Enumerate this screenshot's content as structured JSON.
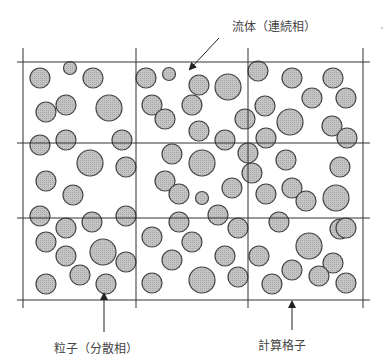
{
  "labels": {
    "fluid": "流体（連続相）",
    "particle": "粒子（分散相）",
    "grid": "計算格子"
  },
  "grid": {
    "x_lines": [
      23,
      136,
      248,
      363
    ],
    "y_lines": [
      62,
      143,
      218,
      300
    ],
    "extent": {
      "x_min": 17,
      "x_max": 370,
      "y_min": 48,
      "y_max": 308
    }
  },
  "colors": {
    "particle_fill": "#bdbdbd",
    "particle_stroke": "#444444",
    "grid_line": "#333333",
    "text": "#444444",
    "background": "#ffffff"
  },
  "arrows": {
    "fluid": {
      "x1": 219,
      "y1": 38,
      "x2": 190,
      "y2": 69
    },
    "particle": {
      "x1": 104,
      "y1": 332,
      "x2": 104,
      "y2": 294
    },
    "grid": {
      "x1": 292,
      "y1": 330,
      "x2": 292,
      "y2": 302
    }
  },
  "particles": [
    {
      "cx": 40,
      "cy": 78,
      "r": 10
    },
    {
      "cx": 70,
      "cy": 68,
      "r": 6.5
    },
    {
      "cx": 93,
      "cy": 78,
      "r": 10
    },
    {
      "cx": 46,
      "cy": 112,
      "r": 10
    },
    {
      "cx": 66,
      "cy": 105,
      "r": 10
    },
    {
      "cx": 109,
      "cy": 108,
      "r": 13
    },
    {
      "cx": 40,
      "cy": 145,
      "r": 10
    },
    {
      "cx": 66,
      "cy": 140,
      "r": 10
    },
    {
      "cx": 122,
      "cy": 140,
      "r": 10
    },
    {
      "cx": 90,
      "cy": 163,
      "r": 13
    },
    {
      "cx": 126,
      "cy": 167,
      "r": 10
    },
    {
      "cx": 46,
      "cy": 181,
      "r": 10
    },
    {
      "cx": 73,
      "cy": 195,
      "r": 10
    },
    {
      "cx": 40,
      "cy": 216,
      "r": 10
    },
    {
      "cx": 66,
      "cy": 228,
      "r": 10
    },
    {
      "cx": 92,
      "cy": 222,
      "r": 10
    },
    {
      "cx": 126,
      "cy": 216,
      "r": 10
    },
    {
      "cx": 46,
      "cy": 242,
      "r": 10
    },
    {
      "cx": 66,
      "cy": 256,
      "r": 10
    },
    {
      "cx": 103,
      "cy": 252,
      "r": 13
    },
    {
      "cx": 126,
      "cy": 262,
      "r": 10
    },
    {
      "cx": 80,
      "cy": 275,
      "r": 10
    },
    {
      "cx": 46,
      "cy": 284,
      "r": 10
    },
    {
      "cx": 106,
      "cy": 284,
      "r": 10
    },
    {
      "cx": 146,
      "cy": 78,
      "r": 10
    },
    {
      "cx": 169,
      "cy": 74,
      "r": 6.5
    },
    {
      "cx": 199,
      "cy": 85,
      "r": 10
    },
    {
      "cx": 228,
      "cy": 87,
      "r": 13
    },
    {
      "cx": 152,
      "cy": 105,
      "r": 10
    },
    {
      "cx": 165,
      "cy": 119,
      "r": 10
    },
    {
      "cx": 192,
      "cy": 105,
      "r": 10
    },
    {
      "cx": 199,
      "cy": 131,
      "r": 10
    },
    {
      "cx": 225,
      "cy": 140,
      "r": 10
    },
    {
      "cx": 245,
      "cy": 119,
      "r": 10
    },
    {
      "cx": 172,
      "cy": 154,
      "r": 10
    },
    {
      "cx": 202,
      "cy": 163,
      "r": 13
    },
    {
      "cx": 248,
      "cy": 153,
      "r": 10
    },
    {
      "cx": 165,
      "cy": 181,
      "r": 10
    },
    {
      "cx": 179,
      "cy": 194,
      "r": 10
    },
    {
      "cx": 202,
      "cy": 198,
      "r": 6.5
    },
    {
      "cx": 232,
      "cy": 188,
      "r": 10
    },
    {
      "cx": 218,
      "cy": 215,
      "r": 10
    },
    {
      "cx": 179,
      "cy": 222,
      "r": 10
    },
    {
      "cx": 238,
      "cy": 228,
      "r": 10
    },
    {
      "cx": 152,
      "cy": 237,
      "r": 10
    },
    {
      "cx": 192,
      "cy": 242,
      "r": 10
    },
    {
      "cx": 225,
      "cy": 256,
      "r": 10
    },
    {
      "cx": 172,
      "cy": 260,
      "r": 10
    },
    {
      "cx": 152,
      "cy": 283,
      "r": 10
    },
    {
      "cx": 202,
      "cy": 280,
      "r": 13
    },
    {
      "cx": 238,
      "cy": 277,
      "r": 10
    },
    {
      "cx": 258,
      "cy": 71,
      "r": 10
    },
    {
      "cx": 292,
      "cy": 78,
      "r": 10
    },
    {
      "cx": 333,
      "cy": 78,
      "r": 10
    },
    {
      "cx": 312,
      "cy": 98,
      "r": 10
    },
    {
      "cx": 346,
      "cy": 98,
      "r": 10
    },
    {
      "cx": 265,
      "cy": 106,
      "r": 10
    },
    {
      "cx": 290,
      "cy": 122,
      "r": 13
    },
    {
      "cx": 332,
      "cy": 126,
      "r": 10
    },
    {
      "cx": 266,
      "cy": 138,
      "r": 10
    },
    {
      "cx": 347,
      "cy": 138,
      "r": 10
    },
    {
      "cx": 286,
      "cy": 160,
      "r": 10
    },
    {
      "cx": 340,
      "cy": 167,
      "r": 10
    },
    {
      "cx": 252,
      "cy": 173,
      "r": 10
    },
    {
      "cx": 292,
      "cy": 188,
      "r": 10
    },
    {
      "cx": 306,
      "cy": 201,
      "r": 10
    },
    {
      "cx": 266,
      "cy": 194,
      "r": 10
    },
    {
      "cx": 336,
      "cy": 198,
      "r": 13
    },
    {
      "cx": 279,
      "cy": 222,
      "r": 10
    },
    {
      "cx": 340,
      "cy": 229,
      "r": 10
    },
    {
      "cx": 259,
      "cy": 256,
      "r": 10
    },
    {
      "cx": 309,
      "cy": 246,
      "r": 13
    },
    {
      "cx": 333,
      "cy": 263,
      "r": 10
    },
    {
      "cx": 292,
      "cy": 270,
      "r": 10
    },
    {
      "cx": 319,
      "cy": 276,
      "r": 10
    },
    {
      "cx": 346,
      "cy": 283,
      "r": 10
    },
    {
      "cx": 272,
      "cy": 284,
      "r": 10
    },
    {
      "cx": 346,
      "cy": 228,
      "r": 10
    }
  ]
}
